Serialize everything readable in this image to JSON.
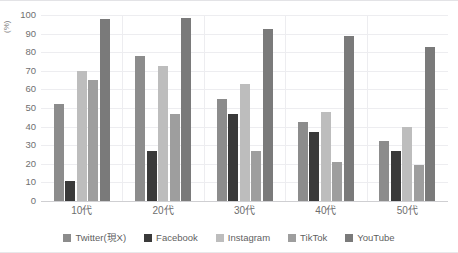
{
  "chart_data": {
    "type": "bar",
    "title": "",
    "subtitle": "",
    "xlabel": "",
    "ylabel": "(%)",
    "ylim": [
      0,
      100
    ],
    "ytick_step": 10,
    "yticks": [
      0,
      10,
      20,
      30,
      40,
      50,
      60,
      70,
      80,
      90,
      100
    ],
    "ytick_labels": [
      "0",
      "10",
      "20",
      "30",
      "40",
      "50",
      "60",
      "70",
      "80",
      "90",
      "100"
    ],
    "grid": true,
    "grid_axis": "y",
    "legend_position": "bottom",
    "categories": [
      "10代",
      "20代",
      "30代",
      "40代",
      "50代"
    ],
    "series": [
      {
        "name": "Twitter(現X)",
        "color": "#8c8c8c",
        "values": [
          52,
          78,
          55,
          42.5,
          32
        ]
      },
      {
        "name": "Facebook",
        "color": "#3a3a3a",
        "values": [
          11,
          27,
          47,
          37,
          27
        ]
      },
      {
        "name": "Instagram",
        "color": "#bdbdbd",
        "values": [
          70,
          72.5,
          63,
          48,
          40
        ]
      },
      {
        "name": "TikTok",
        "color": "#9e9e9e",
        "values": [
          65,
          47,
          27,
          21,
          19.5
        ]
      },
      {
        "name": "YouTube",
        "color": "#7a7a7a",
        "values": [
          98,
          98.5,
          92.5,
          88.5,
          83
        ]
      }
    ]
  },
  "legend": {
    "items": [
      {
        "label": "Twitter(現X)",
        "swatch": "legend-swatch-twitter"
      },
      {
        "label": "Facebook",
        "swatch": "legend-swatch-facebook"
      },
      {
        "label": "Instagram",
        "swatch": "legend-swatch-instagram"
      },
      {
        "label": "TikTok",
        "swatch": "legend-swatch-tiktok"
      },
      {
        "label": "YouTube",
        "swatch": "legend-swatch-youtube"
      }
    ]
  }
}
